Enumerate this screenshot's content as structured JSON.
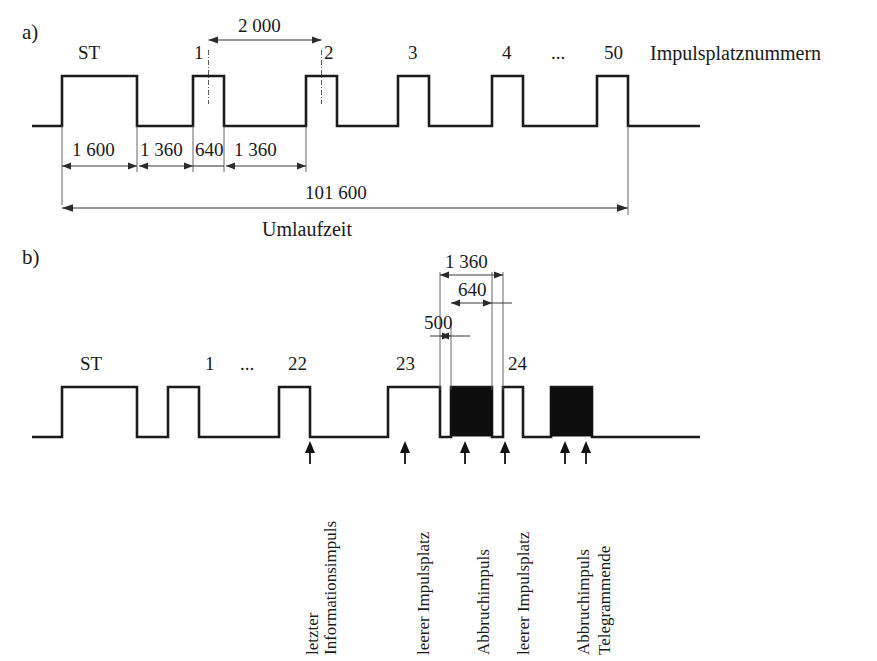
{
  "figure": {
    "panels": [
      {
        "id": "a",
        "letter": "a)",
        "slot_labels": [
          "ST",
          "1",
          "2",
          "3",
          "4",
          "...",
          "50"
        ],
        "axis_caption": "Impulsplatznummern",
        "dimensions": {
          "d2000": "2 000",
          "d1600": "1 600",
          "d1360_a": "1 360",
          "d640": "640",
          "d1360_b": "1 360",
          "total": "101 600",
          "total_caption": "Umlaufzeit"
        }
      },
      {
        "id": "b",
        "letter": "b)",
        "slot_labels": [
          "ST",
          "1",
          "...",
          "22",
          "23",
          "24"
        ],
        "dimensions": {
          "d1360": "1 360",
          "d640": "640",
          "d500": "500"
        },
        "callouts": [
          {
            "id": "letzter-informationsimpuls",
            "line1": "letzter",
            "line2": "Informationsimpuls"
          },
          {
            "id": "leerer-impulsplatz-1",
            "line1": "leerer Impulsplatz",
            "line2": ""
          },
          {
            "id": "abbruchimpuls-1",
            "line1": "Abbruchimpuls",
            "line2": ""
          },
          {
            "id": "leerer-impulsplatz-2",
            "line1": "leerer Impulsplatz",
            "line2": ""
          },
          {
            "id": "abbruchimpuls-2",
            "line1": "Abbruchimpuls",
            "line2": ""
          },
          {
            "id": "telegrammende",
            "line1": "Telegrammende",
            "line2": ""
          }
        ]
      }
    ],
    "colors": {
      "ink": "#1b1b1b",
      "dimension": "#3a3a3a",
      "fill_pulse": "#0d0d0d",
      "background": "#ffffff"
    }
  }
}
